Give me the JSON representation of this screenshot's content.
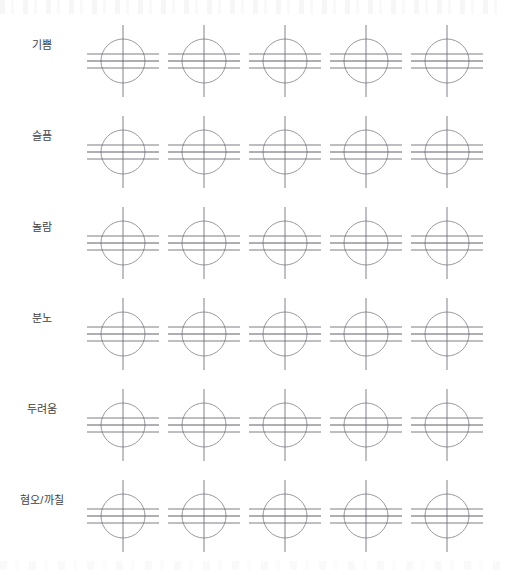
{
  "page": {
    "background_color": "#ffffff",
    "width": 506,
    "height": 575,
    "columns_per_row": 5
  },
  "style": {
    "circle_stroke_color": "#8d8d95",
    "axis_stroke_color": "#75757d",
    "hline_stroke_color": "#6f6f77",
    "label_text_color": "#3f3f42"
  },
  "legend": {
    "glyph_name": "circle-with-crosshair-and-three-horizontal-lines"
  },
  "rows": [
    {
      "label": "기쁨",
      "label_name": "row-label-joy",
      "row_index": 1,
      "cells": [
        {
          "cell_index": 1,
          "icon": "circle-crosshair-icon"
        },
        {
          "cell_index": 2,
          "icon": "circle-crosshair-icon"
        },
        {
          "cell_index": 3,
          "icon": "circle-crosshair-icon"
        },
        {
          "cell_index": 4,
          "icon": "circle-crosshair-icon"
        },
        {
          "cell_index": 5,
          "icon": "circle-crosshair-icon"
        }
      ]
    },
    {
      "label": "슬픔",
      "label_name": "row-label-sadness",
      "row_index": 2,
      "cells": [
        {
          "cell_index": 1,
          "icon": "circle-crosshair-icon"
        },
        {
          "cell_index": 2,
          "icon": "circle-crosshair-icon"
        },
        {
          "cell_index": 3,
          "icon": "circle-crosshair-icon"
        },
        {
          "cell_index": 4,
          "icon": "circle-crosshair-icon"
        },
        {
          "cell_index": 5,
          "icon": "circle-crosshair-icon"
        }
      ]
    },
    {
      "label": "놀람",
      "label_name": "row-label-surprise",
      "row_index": 3,
      "cells": [
        {
          "cell_index": 1,
          "icon": "circle-crosshair-icon"
        },
        {
          "cell_index": 2,
          "icon": "circle-crosshair-icon"
        },
        {
          "cell_index": 3,
          "icon": "circle-crosshair-icon"
        },
        {
          "cell_index": 4,
          "icon": "circle-crosshair-icon"
        },
        {
          "cell_index": 5,
          "icon": "circle-crosshair-icon"
        }
      ]
    },
    {
      "label": "분노",
      "label_name": "row-label-anger",
      "row_index": 4,
      "cells": [
        {
          "cell_index": 1,
          "icon": "circle-crosshair-icon"
        },
        {
          "cell_index": 2,
          "icon": "circle-crosshair-icon"
        },
        {
          "cell_index": 3,
          "icon": "circle-crosshair-icon"
        },
        {
          "cell_index": 4,
          "icon": "circle-crosshair-icon"
        },
        {
          "cell_index": 5,
          "icon": "circle-crosshair-icon"
        }
      ]
    },
    {
      "label": "두려움",
      "label_name": "row-label-fear",
      "row_index": 5,
      "cells": [
        {
          "cell_index": 1,
          "icon": "circle-crosshair-icon"
        },
        {
          "cell_index": 2,
          "icon": "circle-crosshair-icon"
        },
        {
          "cell_index": 3,
          "icon": "circle-crosshair-icon"
        },
        {
          "cell_index": 4,
          "icon": "circle-crosshair-icon"
        },
        {
          "cell_index": 5,
          "icon": "circle-crosshair-icon"
        }
      ]
    },
    {
      "label": "혐오/까칠",
      "label_name": "row-label-disgust",
      "row_index": 6,
      "cells": [
        {
          "cell_index": 1,
          "icon": "circle-crosshair-icon"
        },
        {
          "cell_index": 2,
          "icon": "circle-crosshair-icon"
        },
        {
          "cell_index": 3,
          "icon": "circle-crosshair-icon"
        },
        {
          "cell_index": 4,
          "icon": "circle-crosshair-icon"
        },
        {
          "cell_index": 5,
          "icon": "circle-crosshair-icon"
        }
      ]
    }
  ]
}
